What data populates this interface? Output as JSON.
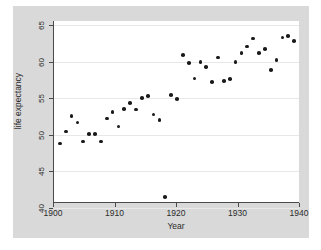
{
  "chart_data": {
    "type": "scatter",
    "title": "",
    "xlabel": "Year",
    "ylabel": "life expectancy",
    "xlim": [
      1899,
      1941
    ],
    "ylim": [
      38.2,
      66.0
    ],
    "xticks": [
      1900,
      1910,
      1920,
      1930,
      1940
    ],
    "yticks": [
      40,
      45,
      50,
      55,
      60,
      65
    ],
    "grid": "horizontal",
    "legend": "none",
    "marker": "filled-circle",
    "marker_color": "#1a1a1a",
    "x": [
      1900,
      1901,
      1902,
      1903,
      1904,
      1905,
      1906,
      1907,
      1908,
      1909,
      1910,
      1911,
      1912,
      1913,
      1914,
      1915,
      1916,
      1917,
      1918,
      1919,
      1920,
      1921,
      1922,
      1923,
      1924,
      1925,
      1926,
      1927,
      1928,
      1929,
      1930,
      1931,
      1932,
      1933,
      1934,
      1935,
      1936,
      1937,
      1938,
      1939,
      1940
    ],
    "values": [
      47.3,
      49.1,
      51.5,
      50.5,
      47.6,
      48.7,
      48.7,
      47.6,
      51.1,
      52.1,
      49.9,
      52.6,
      53.5,
      52.5,
      54.2,
      54.5,
      51.7,
      50.9,
      39.1,
      54.7,
      54.1,
      60.8,
      59.6,
      57.2,
      59.7,
      59.0,
      56.7,
      60.4,
      56.8,
      57.1,
      59.7,
      61.1,
      62.1,
      63.3,
      61.1,
      61.7,
      58.5,
      60.0,
      63.5,
      63.7,
      62.9
    ]
  },
  "axes": {
    "y_tick_labels": [
      "65",
      "60",
      "55",
      "50",
      "45",
      "40"
    ],
    "x_tick_labels": [
      "1900",
      "1910",
      "1920",
      "1930",
      "1940"
    ],
    "x_axis_title": "Year",
    "y_axis_title": "life expectancy"
  }
}
